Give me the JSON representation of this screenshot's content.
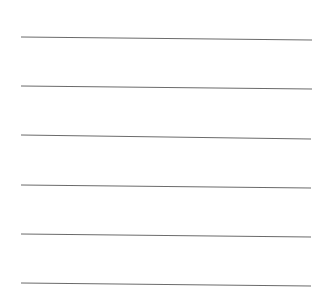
{
  "page": {
    "width": 331,
    "height": 308,
    "background": "#ffffff"
  },
  "lines": {
    "color": "#6b6b6b",
    "items": [
      {
        "x1": 21,
        "y1": 37,
        "x2": 312,
        "y2": 40
      },
      {
        "x1": 21,
        "y1": 86,
        "x2": 312,
        "y2": 89
      },
      {
        "x1": 21,
        "y1": 135,
        "x2": 311,
        "y2": 139
      },
      {
        "x1": 21,
        "y1": 185,
        "x2": 311,
        "y2": 188
      },
      {
        "x1": 21,
        "y1": 234,
        "x2": 311,
        "y2": 237
      },
      {
        "x1": 21,
        "y1": 283,
        "x2": 311,
        "y2": 286
      }
    ]
  }
}
